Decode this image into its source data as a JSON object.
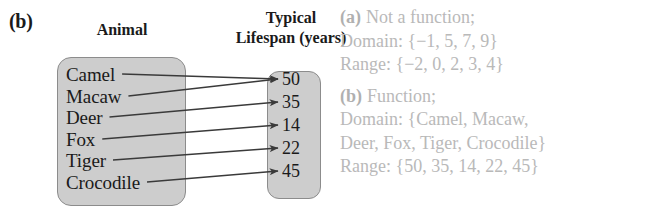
{
  "figure": {
    "part_label": "(b)",
    "headers": {
      "left_column": "Animal",
      "right_column_line1": "Typical",
      "right_column_line2": "Lifespan (years)"
    },
    "domain_items": [
      {
        "label": "Camel",
        "y": 78
      },
      {
        "label": "Macaw",
        "y": 100
      },
      {
        "label": "Deer",
        "y": 121
      },
      {
        "label": "Fox",
        "y": 143
      },
      {
        "label": "Tiger",
        "y": 164
      },
      {
        "label": "Crocodile",
        "y": 186
      }
    ],
    "range_items": [
      {
        "label": "50",
        "y": 83
      },
      {
        "label": "35",
        "y": 106
      },
      {
        "label": "14",
        "y": 129
      },
      {
        "label": "22",
        "y": 152
      },
      {
        "label": "45",
        "y": 175
      }
    ],
    "mappings": [
      {
        "from": "Camel",
        "to": "50"
      },
      {
        "from": "Macaw",
        "to": "50"
      },
      {
        "from": "Deer",
        "to": "35"
      },
      {
        "from": "Fox",
        "to": "14"
      },
      {
        "from": "Tiger",
        "to": "22"
      },
      {
        "from": "Crocodile",
        "to": "45"
      }
    ],
    "colors": {
      "box_fill": "#cdcdcd",
      "box_stroke": "#8c8c8c",
      "arrow": "#3a3a3a",
      "text": "#1a1a1a",
      "answer_text": "#b9b9b9"
    }
  },
  "answers": {
    "a": {
      "tag": "(a)",
      "verdict": "Not a function;",
      "domain": "Domain: {−1, 5, 7, 9}",
      "range": "Range: {−2, 0, 2, 3, 4}"
    },
    "b": {
      "tag": "(b)",
      "verdict": "Function;",
      "domain_line1": "Domain: {Camel, Macaw,",
      "domain_line2": "Deer, Fox, Tiger, Crocodile}",
      "range": "Range: {50, 35, 14, 22, 45}"
    }
  }
}
